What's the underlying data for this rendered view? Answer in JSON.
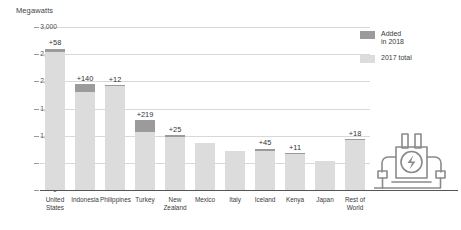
{
  "chart_data": {
    "type": "bar",
    "subtype": "stacked",
    "title": "",
    "xlabel": "",
    "ylabel": "Megawatts",
    "ylim": [
      0,
      3000
    ],
    "ytick_labels": [
      "3,000",
      "2,500",
      "2,000",
      "1,500",
      "1,000",
      "500",
      "0"
    ],
    "ytick_values": [
      3000,
      2500,
      2000,
      1500,
      1000,
      500,
      0
    ],
    "grid": true,
    "legend_position": "right",
    "categories": [
      "United\nStates",
      "Indonesia",
      "Philippines",
      "Turkey",
      "New\nZealand",
      "Mexico",
      "Italy",
      "Iceland",
      "Kenya",
      "Japan",
      "Rest of\nWorld"
    ],
    "series": [
      {
        "name": "2017 total",
        "color": "#dcdcdc",
        "values": [
          2542,
          1809,
          1916,
          1064,
          981,
          873,
          722,
          710,
          665,
          533,
          912
        ]
      },
      {
        "name": "Added in 2018",
        "color": "#9b9b9b",
        "values": [
          58,
          140,
          12,
          219,
          25,
          0,
          0,
          45,
          11,
          0,
          18
        ]
      }
    ],
    "data_labels": [
      "+58",
      "+140",
      "+12",
      "+219",
      "+25",
      "",
      "",
      "+45",
      "+11",
      "",
      "+18"
    ],
    "data_label_values": [
      58,
      140,
      12,
      219,
      25,
      null,
      null,
      45,
      11,
      null,
      18
    ]
  },
  "legend": {
    "items": [
      {
        "label": "Added\nin 2018",
        "color": "#9b9b9b",
        "name": "added-in-2018"
      },
      {
        "label": "2017 total",
        "color": "#dcdcdc",
        "name": "2017-total"
      }
    ]
  },
  "icons": {
    "plant": "power-plant-icon"
  }
}
